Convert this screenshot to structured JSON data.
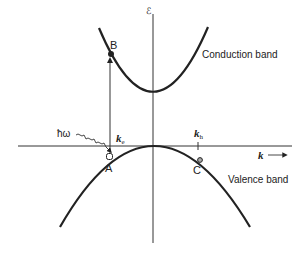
{
  "diagram": {
    "axes": {
      "energy_axis_label": "ℰ",
      "k_axis_label": "k",
      "k_axis_arrow": "⟶"
    },
    "bands": {
      "conduction": "Conduction band",
      "valence": "Valence band"
    },
    "points": {
      "A": "A",
      "B": "B",
      "C": "C"
    },
    "photon_label": "ħω",
    "k_labels": {
      "ke_main": "k",
      "ke_sub": "e",
      "kh_main": "k",
      "kh_sub": "h"
    },
    "colors": {
      "line": "#222222",
      "background": "#ffffff"
    }
  }
}
